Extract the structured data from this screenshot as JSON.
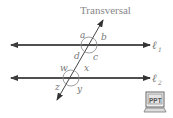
{
  "diagram": {
    "title": "Transversal",
    "lines": [
      {
        "id": "l1",
        "label": "ℓ",
        "subscript": "1",
        "y": 45
      },
      {
        "id": "l2",
        "label": "ℓ",
        "subscript": "2",
        "y": 78
      }
    ],
    "angles_top": {
      "a": "a",
      "b": "b",
      "c": "c",
      "d": "d"
    },
    "angles_bottom": {
      "w": "w",
      "x": "x",
      "y": "y",
      "z": "z"
    },
    "colors": {
      "line": "#444444",
      "label": "#777777",
      "title": "#888888"
    }
  },
  "ppt_icon": {
    "label": "PPT"
  }
}
